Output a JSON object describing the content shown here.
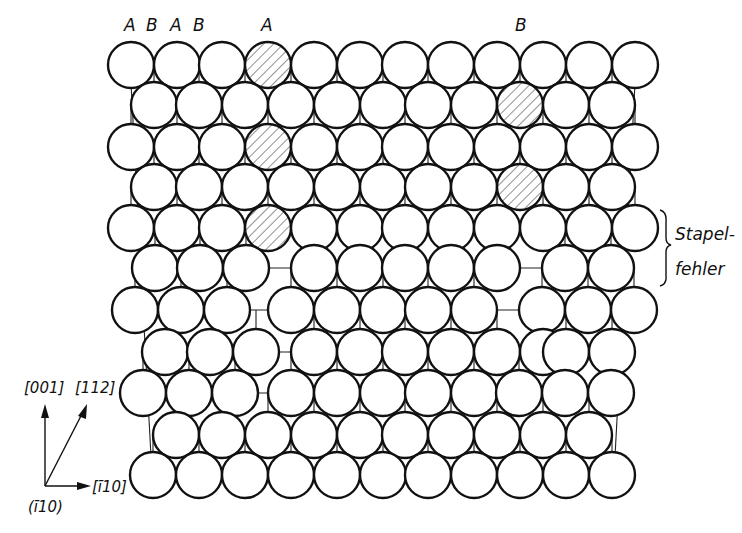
{
  "figure": {
    "layer_labels": [
      {
        "text": "A",
        "x": 124,
        "y": 31
      },
      {
        "text": "B",
        "x": 146,
        "y": 31
      },
      {
        "text": "A",
        "x": 170,
        "y": 31
      },
      {
        "text": "B",
        "x": 193,
        "y": 31
      },
      {
        "text": "A",
        "x": 261,
        "y": 31
      },
      {
        "text": "B",
        "x": 515,
        "y": 31
      }
    ],
    "annotation": {
      "line1": "Stapel-",
      "line2": "fehler"
    },
    "axes": {
      "up_label": "[001]",
      "diag_label": "[112]",
      "right_label": "[ī10]",
      "plane_label": "(ī10)"
    },
    "atom_radius": 23,
    "rows": [
      {
        "y": 65,
        "x": [
          131,
          177,
          222,
          268,
          314,
          360,
          405,
          451,
          497,
          543,
          589,
          635
        ],
        "hatched": [
          268
        ]
      },
      {
        "y": 105,
        "x": [
          154,
          199,
          245,
          291,
          337,
          383,
          428,
          474,
          520,
          566,
          612
        ],
        "hatched": [
          520
        ]
      },
      {
        "y": 147,
        "x": [
          131,
          177,
          222,
          268,
          314,
          360,
          405,
          451,
          497,
          543,
          589,
          635
        ],
        "hatched": [
          268
        ]
      },
      {
        "y": 187,
        "x": [
          154,
          199,
          245,
          291,
          337,
          383,
          428,
          474,
          520,
          566,
          612
        ],
        "hatched": [
          520
        ]
      },
      {
        "y": 228,
        "x": [
          131,
          177,
          222,
          268,
          314,
          360,
          405,
          451,
          497,
          543,
          589,
          635
        ],
        "hatched": [
          268
        ]
      },
      {
        "y": 268,
        "x": [
          155,
          200,
          246,
          314,
          360,
          405,
          451,
          497,
          565,
          611
        ],
        "hatched": []
      },
      {
        "y": 310,
        "x": [
          135,
          181,
          227,
          291,
          337,
          383,
          428,
          474,
          542,
          588,
          634
        ],
        "hatched": []
      },
      {
        "y": 352,
        "x": [
          165,
          210,
          256,
          314,
          360,
          405,
          451,
          497,
          543,
          566,
          612
        ],
        "hatched": []
      },
      {
        "y": 393,
        "x": [
          143,
          189,
          235,
          291,
          337,
          383,
          428,
          474,
          519,
          565,
          611
        ],
        "hatched": []
      },
      {
        "y": 435,
        "x": [
          176,
          222,
          268,
          314,
          360,
          405,
          451,
          497,
          543,
          589
        ],
        "hatched": []
      },
      {
        "y": 475,
        "x": [
          153,
          199,
          245,
          291,
          337,
          383,
          428,
          474,
          520,
          566,
          612
        ],
        "hatched": []
      }
    ],
    "frame": {
      "x0": 130,
      "x1": 636,
      "y_top": 65,
      "y_bot": 475
    }
  }
}
